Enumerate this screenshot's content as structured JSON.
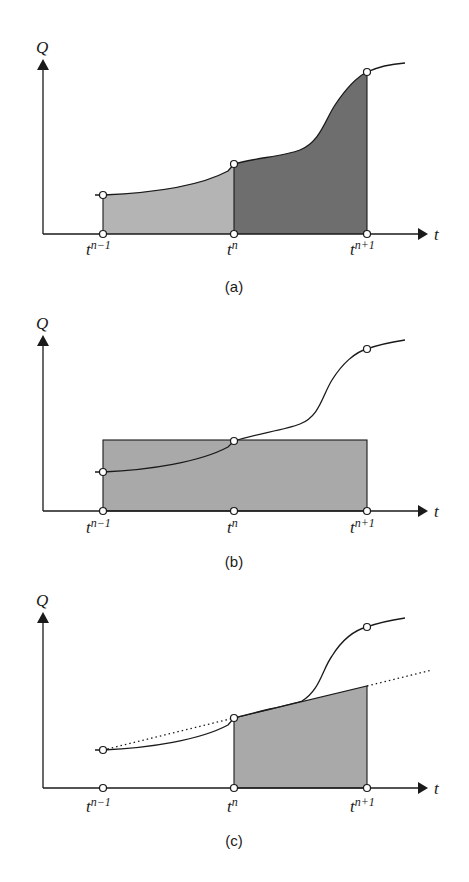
{
  "figure": {
    "y_axis_label": "Q",
    "x_axis_label": "t",
    "ticks": [
      {
        "base": "t",
        "sup": "n−1"
      },
      {
        "base": "t",
        "sup": "n"
      },
      {
        "base": "t",
        "sup": "n+1"
      }
    ],
    "colors": {
      "light_fill": "#b4b4b4",
      "dark_fill": "#6e6e6e",
      "medium_fill": "#a9a9a9",
      "line": "#1a1a1a"
    },
    "panels": [
      {
        "caption": "(a)",
        "description": "Area under Q(t) split into light region [t^(n-1), t^n] and dark region [t^n, t^(n+1)]"
      },
      {
        "caption": "(b)",
        "description": "Rectangle of height Q(t^n) spanning [t^(n-1), t^(n+1)] (midpoint rule)"
      },
      {
        "caption": "(c)",
        "description": "Trapezoid over [t^n, t^(n+1)] with slope extrapolated from t^(n-1), t^n (dotted line)"
      }
    ]
  }
}
